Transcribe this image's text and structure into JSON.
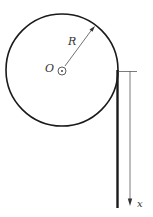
{
  "diagram": {
    "labels": {
      "radius": "R",
      "center": "O",
      "axis": "x"
    },
    "colors": {
      "stroke": "#1a1a1a",
      "thin": "#444444",
      "background": "#ffffff"
    }
  }
}
